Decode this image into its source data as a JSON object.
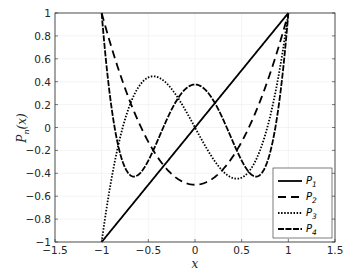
{
  "chart_data": {
    "type": "line",
    "title": "",
    "xlabel": "x",
    "ylabel": "P_n(x)",
    "xlim": [
      -1.5,
      1.5
    ],
    "ylim": [
      -1,
      1
    ],
    "grid": true,
    "legend_position": "lower right",
    "xticks": [
      "-1.5",
      "-1",
      "-0.5",
      "0",
      "0.5",
      "1",
      "1.5"
    ],
    "yticks": [
      "1",
      "0.8",
      "0.6",
      "0.4",
      "0.2",
      "0",
      "-0.2",
      "-0.4",
      "-0.6",
      "-0.8",
      "-1"
    ],
    "x_domain": [
      -1,
      1
    ],
    "series": [
      {
        "name": "P_1",
        "label_base": "P",
        "label_sub": "1",
        "style": "solid",
        "formula": "x",
        "x": [
          -1,
          -0.5,
          0,
          0.5,
          1
        ],
        "values": [
          -1,
          -0.5,
          0,
          0.5,
          1
        ]
      },
      {
        "name": "P_2",
        "label_base": "P",
        "label_sub": "2",
        "style": "dashed",
        "formula": "(3x^2-1)/2",
        "x": [
          -1,
          -0.5,
          0,
          0.5,
          1
        ],
        "values": [
          1,
          -0.125,
          -0.5,
          -0.125,
          1
        ]
      },
      {
        "name": "P_3",
        "label_base": "P",
        "label_sub": "3",
        "style": "dotted",
        "formula": "(5x^3-3x)/2",
        "x": [
          -1,
          -0.775,
          -0.447,
          0,
          0.447,
          0.775,
          1
        ],
        "values": [
          -1,
          0,
          0.447,
          0,
          -0.447,
          0,
          1
        ]
      },
      {
        "name": "P_4",
        "label_base": "P",
        "label_sub": "4",
        "style": "dash-dot",
        "formula": "(35x^4-30x^2+3)/8",
        "x": [
          -1,
          -0.655,
          0,
          0.655,
          1
        ],
        "values": [
          1,
          -0.429,
          0.375,
          -0.429,
          1
        ]
      }
    ]
  }
}
